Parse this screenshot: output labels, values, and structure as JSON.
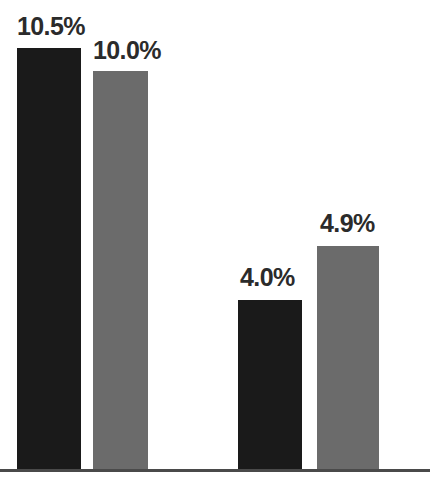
{
  "chart_data": {
    "type": "bar",
    "title": "",
    "subtitle": "",
    "xlabel": "",
    "ylabel": "",
    "categories": [
      "Group 1",
      "Group 2"
    ],
    "series": [
      {
        "name": "Dark series",
        "color": "#1a1a1a",
        "values": [
          10.5,
          4.0
        ]
      },
      {
        "name": "Gray series",
        "color": "#6b6b6b",
        "values": [
          10.0,
          4.9
        ]
      }
    ],
    "bars": [
      {
        "label": "10.5%",
        "value": 10.5,
        "color": "#1a1a1a",
        "group": "Group 1",
        "series": "Dark series"
      },
      {
        "label": "10.0%",
        "value": 10.0,
        "color": "#6b6b6b",
        "group": "Group 1",
        "series": "Gray series"
      },
      {
        "label": "4.0%",
        "value": 4.0,
        "color": "#1a1a1a",
        "group": "Group 2",
        "series": "Dark series"
      },
      {
        "label": "4.9%",
        "value": 4.9,
        "color": "#6b6b6b",
        "group": "Group 2",
        "series": "Gray series"
      }
    ],
    "value_labels": [
      "10.5%",
      "10.0%",
      "4.0%",
      "4.9%"
    ],
    "ylim": [
      0,
      11.7
    ],
    "xlim": [
      0,
      430
    ],
    "grid": false,
    "legend": false,
    "legend_position": "none",
    "axis_line_color": "#4a4a4a",
    "background": "#ffffff",
    "tick_labels_x": [],
    "tick_labels_y": [],
    "annotations": []
  },
  "axis": {
    "baseline_y": 469
  },
  "geometry": {
    "bars": [
      {
        "x": 17,
        "y": 48,
        "w": 64,
        "h": 421
      },
      {
        "x": 93,
        "y": 71,
        "w": 55,
        "h": 398
      },
      {
        "x": 238,
        "y": 300,
        "w": 64,
        "h": 169
      },
      {
        "x": 317,
        "y": 246,
        "w": 62,
        "h": 223
      }
    ],
    "labels": [
      {
        "x": 17,
        "y": 14
      },
      {
        "x": 93,
        "y": 38
      },
      {
        "x": 240,
        "y": 265
      },
      {
        "x": 320,
        "y": 211
      }
    ]
  }
}
